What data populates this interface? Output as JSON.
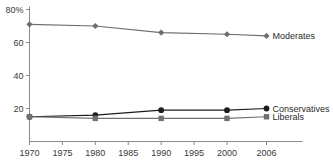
{
  "chart_data": {
    "type": "line",
    "title": "",
    "subtitle": "",
    "xlabel": "",
    "ylabel": "",
    "x": [
      1970,
      1980,
      1990,
      2000,
      2006
    ],
    "xlim": [
      1970,
      2006
    ],
    "ylim": [
      0,
      80
    ],
    "x_tick_labels": [
      "1970",
      "1975",
      "1980",
      "1985",
      "1990",
      "1995",
      "2000",
      "2006"
    ],
    "x_tick_values": [
      1970,
      1975,
      1980,
      1985,
      1990,
      1995,
      2000,
      2006
    ],
    "y_tick_labels": [
      "20",
      "40",
      "60",
      "80%"
    ],
    "y_tick_values": [
      20,
      40,
      60,
      80
    ],
    "grid": false,
    "legend_position": "line-end-right",
    "series": [
      {
        "name": "Moderates",
        "values": [
          71,
          70,
          66,
          65,
          64
        ],
        "marker": "diamond",
        "color": "#6e6e6e"
      },
      {
        "name": "Conservatives",
        "values": [
          15,
          16,
          19,
          19,
          20
        ],
        "marker": "circle",
        "color": "#1c1c1c"
      },
      {
        "name": "Liberals",
        "values": [
          15,
          14,
          14,
          14,
          15
        ],
        "marker": "square",
        "color": "#707070"
      }
    ]
  },
  "axis": {
    "axis_color": "#8c8c8c",
    "tick_color": "#8c8c8c",
    "label_color": "#3a3a3a"
  }
}
